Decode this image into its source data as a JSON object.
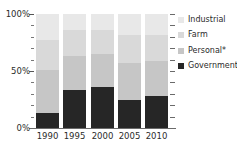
{
  "chart_data": {
    "type": "bar",
    "stacked": true,
    "percent": true,
    "title": "",
    "xlabel": "",
    "ylabel": "",
    "ylim": [
      0,
      100
    ],
    "ytick_labels": [
      "0%",
      "50%",
      "100%"
    ],
    "ytick_values": [
      0,
      50,
      100
    ],
    "yminor_step": 10,
    "grid": false,
    "legend_position": "right",
    "categories": [
      "1990",
      "1995",
      "2000",
      "2005",
      "2010"
    ],
    "series": [
      {
        "name": "Government",
        "color": "#262626",
        "values": [
          13,
          33,
          36,
          25,
          28
        ]
      },
      {
        "name": "Personal*",
        "color": "#c6c6c6",
        "values": [
          38,
          30,
          29,
          32,
          31
        ]
      },
      {
        "name": "Farm",
        "color": "#d9d9d9",
        "values": [
          26,
          23,
          21,
          25,
          23
        ]
      },
      {
        "name": "Industrial",
        "color": "#e8e8e8",
        "values": [
          23,
          14,
          14,
          18,
          18
        ]
      }
    ]
  },
  "legend": {
    "items": [
      {
        "label": "Industrial",
        "color": "#e8e8e8"
      },
      {
        "label": "Farm",
        "color": "#d9d9d9"
      },
      {
        "label": "Personal*",
        "color": "#c6c6c6"
      },
      {
        "label": "Government",
        "color": "#262626"
      }
    ]
  },
  "title_sliver": {
    "text": ""
  }
}
